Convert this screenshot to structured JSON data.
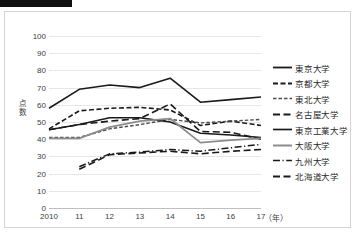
{
  "figure": {
    "redaction_bar": "black-bar",
    "border_color": "#d4d4d4",
    "background": "#ffffff"
  },
  "chart_data": {
    "type": "line",
    "title": "",
    "xlabel": "（年）",
    "ylabel": "点数",
    "x": [
      "2010",
      "11",
      "12",
      "13",
      "14",
      "15",
      "16",
      "17"
    ],
    "xtick_labels": [
      "2010",
      "11",
      "12",
      "13",
      "14",
      "15",
      "16",
      "17"
    ],
    "ytick_labels": [
      "0",
      "10",
      "20",
      "30",
      "40",
      "50",
      "60",
      "70",
      "80",
      "90",
      "100"
    ],
    "ylim": [
      0,
      100
    ],
    "ytick_step": 10,
    "grid": true,
    "legend_position": "right",
    "series": [
      {
        "name": "東京大学",
        "style": "solid",
        "color": "#1a1a1a",
        "width": 1.6,
        "values": [
          58,
          69,
          71.5,
          70,
          75.5,
          61.5,
          63,
          64.5
        ]
      },
      {
        "name": "京都大学",
        "style": "dashed",
        "color": "#1a1a1a",
        "width": 1.6,
        "values": [
          46,
          56.5,
          58,
          58.5,
          57,
          48,
          50.5,
          48
        ]
      },
      {
        "name": "東北大学",
        "style": "dashed-fine",
        "color": "#4d4d4d",
        "width": 1.4,
        "values": [
          41,
          41,
          46,
          48.5,
          51.5,
          49.5,
          50.5,
          51.5
        ]
      },
      {
        "name": "名古屋大学",
        "style": "long-dash",
        "color": "#1a1a1a",
        "width": 1.6,
        "values": [
          45.5,
          48.5,
          50.5,
          52,
          60.5,
          44.5,
          44,
          40
        ]
      },
      {
        "name": "東京工業大学",
        "style": "solid",
        "color": "#1a1a1a",
        "width": 1.5,
        "values": [
          45.5,
          48.5,
          52.5,
          52.5,
          50,
          43.5,
          42.5,
          41
        ]
      },
      {
        "name": "大阪大学",
        "style": "solid",
        "color": "#8c8c8c",
        "width": 1.8,
        "values": [
          40.5,
          40.5,
          47,
          50.5,
          52,
          38,
          39.5,
          40.5
        ]
      },
      {
        "name": "九州大学",
        "style": "dash-dot",
        "color": "#1a1a1a",
        "width": 1.5,
        "values": [
          null,
          24,
          31.5,
          32.5,
          34,
          33,
          35,
          37
        ]
      },
      {
        "name": "北海道大学",
        "style": "long-dash",
        "color": "#1a1a1a",
        "width": 1.6,
        "values": [
          null,
          22.5,
          31,
          32,
          33,
          31.5,
          33,
          34
        ]
      }
    ]
  },
  "legend": {
    "items": [
      {
        "label": "東京大学"
      },
      {
        "label": "京都大学"
      },
      {
        "label": "東北大学"
      },
      {
        "label": "名古屋大学"
      },
      {
        "label": "東京工業大学"
      },
      {
        "label": "大阪大学"
      },
      {
        "label": "九州大学"
      },
      {
        "label": "北海道大学"
      }
    ]
  }
}
